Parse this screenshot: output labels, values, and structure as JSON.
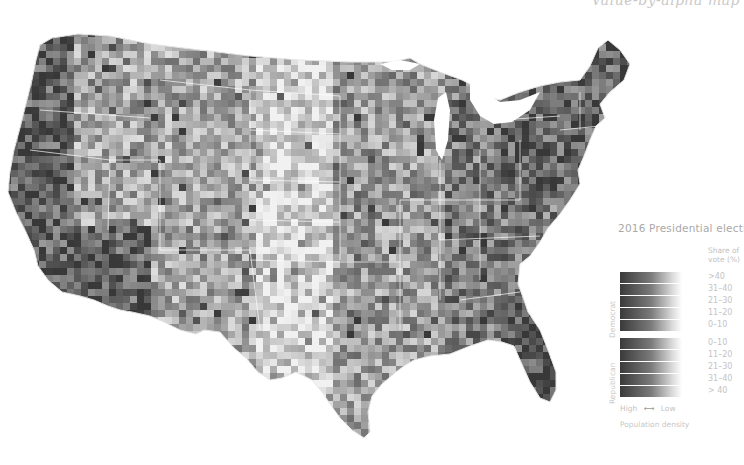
{
  "map": {
    "title": "Value-by-alpha map",
    "subject": "2016 Presidential election county results, contiguous United States",
    "color_scheme": {
      "high": "#2e2e2e",
      "mid": "#8a8a8a",
      "low": "#f2f2f2",
      "background": "#ffffff",
      "state_borders": "#ffffff"
    }
  },
  "legend": {
    "title": "2016 Presidential election",
    "header": "Share of vote (%)",
    "groups": [
      {
        "name": "Democrat",
        "bins": [
          ">40",
          "31–40",
          "21–30",
          "11–20",
          "0–10"
        ]
      },
      {
        "name": "Republican",
        "bins": [
          "0–10",
          "11–20",
          "21–30",
          "31–40",
          "> 40"
        ]
      }
    ],
    "density": {
      "high_label": "High",
      "arrow": "⟷",
      "low_label": "Low",
      "caption": "Population density"
    }
  }
}
